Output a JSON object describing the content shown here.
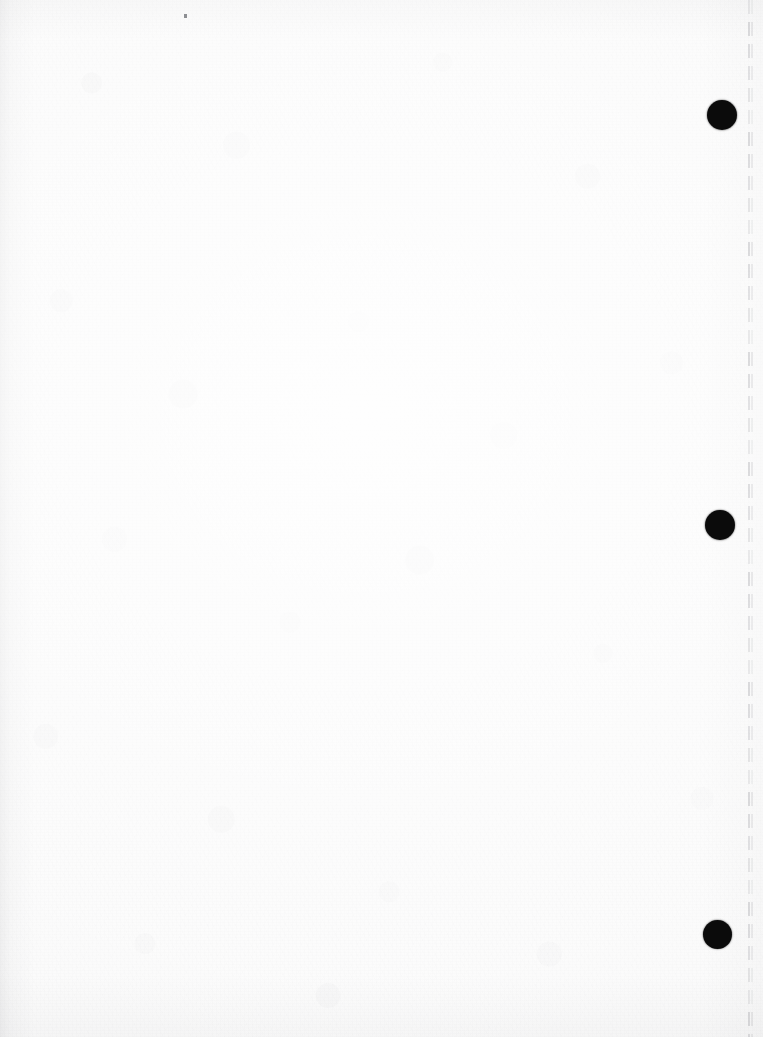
{
  "document": {
    "kind": "scanned-page",
    "title": "Scanned blank page",
    "page_width": 763,
    "page_height": 1037,
    "content_text": "",
    "description": "Blank three-hole-punched sheet of paper, scanned; faint vertical dashed perforation line near the right edge.",
    "paper_color": "#fbfbfb",
    "ink_color": "#0b0b0b",
    "shadow_color": "#8a8a8f"
  },
  "punch_holes": {
    "count": 3,
    "label": "three-hole-punch",
    "fill_color": "#0b0b0b",
    "items": [
      {
        "id": "top",
        "label": "punch-hole-top",
        "cx": 722,
        "cy": 115,
        "diameter": 30
      },
      {
        "id": "middle",
        "label": "punch-hole-middle",
        "cx": 720,
        "cy": 525,
        "diameter": 30
      },
      {
        "id": "bottom",
        "label": "punch-hole-bottom",
        "cx": 717,
        "cy": 934,
        "diameter": 29
      }
    ]
  },
  "perforation": {
    "label": "perforation-line",
    "orientation": "vertical",
    "x": 748,
    "x_secondary": 751,
    "color": "#7a7c80",
    "dash_length": 14,
    "gap_length": 8,
    "top": 0,
    "bottom": 1037
  },
  "artifacts": {
    "speck": {
      "label": "scan-speck",
      "x": 184,
      "y": 14,
      "width": 3,
      "height": 4
    }
  }
}
